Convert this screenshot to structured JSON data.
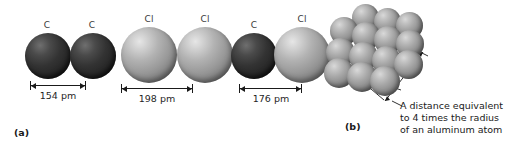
{
  "figure": {
    "background": "#ffffff",
    "panels": [
      {
        "id": "a",
        "label": "(a)"
      },
      {
        "id": "b",
        "label": "(b)"
      }
    ]
  },
  "panel_a": {
    "pairs": [
      {
        "id": "c-c",
        "left_atom_label": "C",
        "right_atom_label": "C",
        "left_atom_color": "#333333",
        "right_atom_color": "#333333",
        "distance_label": "154 pm",
        "distance_value": 154,
        "distance_unit": "pm"
      },
      {
        "id": "cl-cl",
        "left_atom_label": "Cl",
        "right_atom_label": "Cl",
        "left_atom_color": "#9a9a9a",
        "right_atom_color": "#9a9a9a",
        "distance_label": "198 pm",
        "distance_value": 198,
        "distance_unit": "pm"
      },
      {
        "id": "c-cl",
        "left_atom_label": "C",
        "right_atom_label": "Cl",
        "left_atom_color": "#333333",
        "right_atom_color": "#9a9a9a",
        "distance_label": "176 pm",
        "distance_value": 176,
        "distance_unit": "pm"
      }
    ]
  },
  "panel_b": {
    "cluster_name": "aluminum-atom-cluster",
    "sphere_color": "#a8a8a8",
    "sphere_count": 14,
    "caption": "A distance equivalent\nto 4 times the radius\nof an aluminum atom"
  }
}
